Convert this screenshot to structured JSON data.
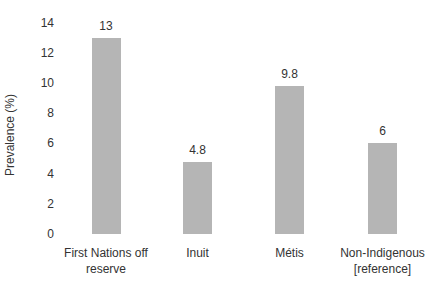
{
  "chart_data": {
    "type": "bar",
    "title": "",
    "xlabel": "",
    "ylabel": "Prevalence (%)",
    "ylim": [
      0,
      14
    ],
    "yticks": [
      0,
      2,
      4,
      6,
      8,
      10,
      12,
      14
    ],
    "grid": false,
    "legend": null,
    "categories": [
      "First Nations off reserve",
      "Inuit",
      "Métis",
      "Non-Indigenous [reference]"
    ],
    "category_lines": [
      [
        "First Nations off",
        "reserve"
      ],
      [
        "Inuit"
      ],
      [
        "Métis"
      ],
      [
        "Non-Indigenous",
        "[reference]"
      ]
    ],
    "values": [
      13,
      4.8,
      9.8,
      6
    ],
    "value_labels": [
      "13",
      "4.8",
      "9.8",
      "6"
    ],
    "bar_color": "#b5b5b5"
  }
}
